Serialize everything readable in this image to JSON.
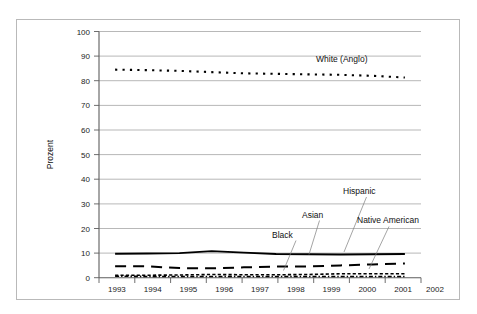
{
  "chart_data": {
    "type": "line",
    "title": "",
    "subtitle": "",
    "xlabel": "",
    "ylabel": "Prozent",
    "xlim": [
      1993,
      2002
    ],
    "ylim": [
      0,
      100
    ],
    "grid": true,
    "legend_position": "inline-annotations",
    "x": [
      1993,
      1994,
      1995,
      1996,
      1997,
      1998,
      1999,
      2000,
      2001,
      2002
    ],
    "xticklabels": [
      "1993",
      "1994",
      "1995",
      "1996",
      "1997",
      "1998",
      "1999",
      "2000",
      "2001",
      "2002"
    ],
    "yticks": [
      0,
      10,
      20,
      30,
      40,
      50,
      60,
      70,
      80,
      90,
      100
    ],
    "yticklabels": [
      "0",
      "10",
      "20",
      "30",
      "40",
      "50",
      "60",
      "70",
      "80",
      "90",
      "100"
    ],
    "series": [
      {
        "name": "White (Anglo)",
        "style": "dotted",
        "label_text": "White (Anglo)",
        "values": [
          84.5,
          84.3,
          84.0,
          83.5,
          83.0,
          82.8,
          82.6,
          82.4,
          82.0,
          81.3
        ]
      },
      {
        "name": "Black",
        "style": "solid",
        "label_text": "Black",
        "values": [
          9.7,
          9.8,
          10.0,
          10.8,
          10.2,
          9.6,
          9.5,
          9.4,
          9.5,
          9.6
        ]
      },
      {
        "name": "Hispanic",
        "style": "long-dash",
        "label_text": "Hispanic",
        "values": [
          4.6,
          4.6,
          3.9,
          3.8,
          4.2,
          4.5,
          4.6,
          5.0,
          5.4,
          5.8
        ]
      },
      {
        "name": "Asian",
        "style": "short-dash",
        "label_text": "Asian",
        "values": [
          1.0,
          1.0,
          1.1,
          1.3,
          1.2,
          1.2,
          1.3,
          1.6,
          1.6,
          1.6
        ]
      },
      {
        "name": "Native American",
        "style": "dash-dot",
        "label_text": "Native American",
        "values": [
          0.6,
          0.5,
          0.5,
          0.5,
          0.5,
          0.5,
          0.5,
          0.5,
          0.5,
          0.5
        ]
      }
    ],
    "annotations": [
      {
        "text": "White (Anglo)",
        "series": "White (Anglo)"
      },
      {
        "text": "Hispanic",
        "series": "Hispanic"
      },
      {
        "text": "Asian",
        "series": "Asian"
      },
      {
        "text": "Black",
        "series": "Black"
      },
      {
        "text": "Native American",
        "series": "Native American"
      }
    ]
  }
}
